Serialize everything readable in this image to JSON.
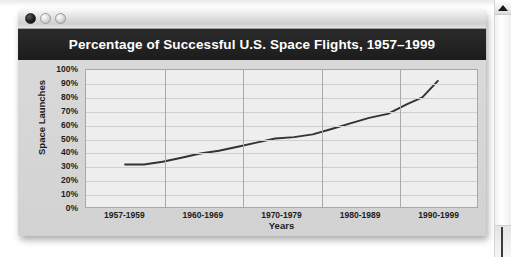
{
  "window": {
    "titlebar": {
      "close_label": "close",
      "minimize_label": "minimize",
      "zoom_label": "zoom"
    }
  },
  "scrollbar": {
    "up_arrow_label": "scroll up"
  },
  "chart_data": {
    "type": "line",
    "title": "Percentage of Successful U.S. Space Flights, 1957–1999",
    "xlabel": "Years",
    "ylabel": "Space Launches",
    "categories": [
      "1957-1959",
      "1960-1969",
      "1970-1979",
      "1980-1989",
      "1990-1999"
    ],
    "ytick_labels": [
      "100%",
      "90%",
      "80%",
      "70%",
      "60%",
      "50%",
      "40%",
      "30%",
      "20%",
      "10%",
      "0%"
    ],
    "ytick_values": [
      100,
      90,
      80,
      70,
      60,
      50,
      40,
      30,
      20,
      10,
      0
    ],
    "ylim": [
      0,
      100
    ],
    "grid": true,
    "legend": false,
    "series": [
      {
        "name": "Percentage of successful flights",
        "color": "#333333",
        "x": [
          0.0,
          0.06,
          0.12,
          0.18,
          0.24,
          0.3,
          0.36,
          0.42,
          0.48,
          0.54,
          0.6,
          0.66,
          0.72,
          0.78,
          0.84,
          0.9,
          0.95,
          1.0
        ],
        "values": [
          31,
          31,
          33,
          36,
          39,
          41,
          44,
          47,
          50,
          51,
          53,
          57,
          61,
          65,
          68,
          75,
          80,
          92
        ]
      }
    ]
  }
}
